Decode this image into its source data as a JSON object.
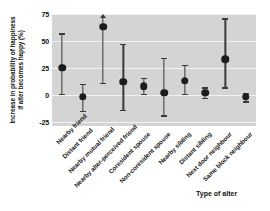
{
  "chart_data": {
    "type": "scatter",
    "title": "",
    "xlabel": "Type of alter",
    "ylabel": "Increase in probability of happiness if alter becomes happy (%)",
    "ylabel_line1": "Increase in probability of happiness",
    "ylabel_line2": "if alter becomes happy (%)",
    "ylim": [
      -29,
      75
    ],
    "yticks": [
      75,
      50,
      25,
      0,
      -25
    ],
    "ytick_labels": [
      "75",
      "50",
      "25",
      "0",
      "-25"
    ],
    "grid": true,
    "legend": "none",
    "categories": [
      "Nearby friend",
      "Distant friend",
      "Nearby mutual friend",
      "Nearby alter-perceived friend",
      "Coresident spouse",
      "Non-coresident spouse",
      "Nearby sibling",
      "Distant sibling",
      "Next door neighbour",
      "Same block neighbour"
    ],
    "values": [
      25,
      -2,
      63,
      12,
      8,
      2,
      13,
      2,
      33,
      -2
    ],
    "ci_low": [
      1,
      -15,
      11,
      -14,
      1,
      -19,
      1,
      -3,
      7,
      -6
    ],
    "ci_high": [
      57,
      10,
      75,
      47,
      16,
      34,
      28,
      7,
      71,
      2
    ],
    "ci_high_clipped": [
      false,
      false,
      true,
      false,
      false,
      false,
      false,
      false,
      false,
      false
    ],
    "marker_color": "#1c1c1c",
    "error_color": "#3a3a3a",
    "panel_color": "#d4d4d4",
    "grid_color": "#f2f2f2"
  }
}
